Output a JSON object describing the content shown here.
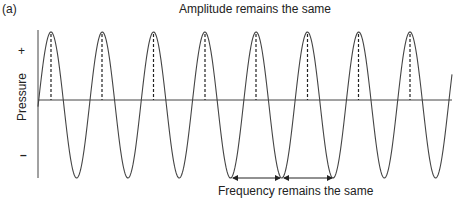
{
  "panel_label": "(a)",
  "top_caption": "Amplitude remains the same",
  "bottom_caption": "Frequency remains the same",
  "y_axis": {
    "label": "Pressure",
    "plus": "+",
    "minus": "–"
  },
  "wave": {
    "type": "sine",
    "cycles_shown": 8,
    "peak_x": [
      51,
      102,
      153.5,
      205,
      256,
      307.5,
      358.5,
      410
    ],
    "baseline_y": 100,
    "peak_y": 32,
    "trough_y": 178,
    "x_start": 38,
    "x_end": 452,
    "color": "#444444"
  },
  "markers": {
    "peak_dashed_lines": true,
    "frequency_arrows": [
      {
        "from_x": 231,
        "to_x": 282,
        "y": 178
      },
      {
        "from_x": 282,
        "to_x": 334,
        "y": 178
      }
    ]
  }
}
